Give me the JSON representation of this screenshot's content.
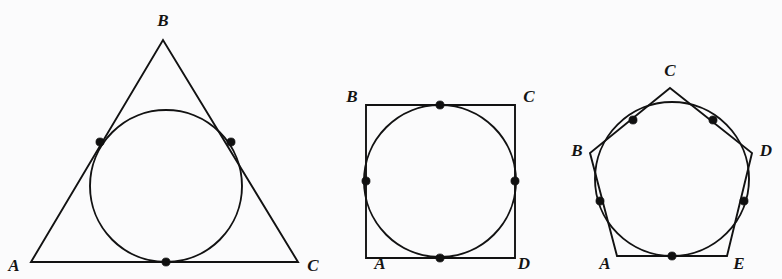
{
  "document": {
    "title": "Circles inscribed in polygons",
    "background_color": "#fbfbfc",
    "ink_color": "#121212",
    "width": 782,
    "height": 279
  },
  "figures": [
    {
      "id": "triangle-figure",
      "name": "triangle-with-inscribed-circle",
      "polygon_type": "triangle",
      "polygon_points": "31,262 163,40 298,262",
      "circle": {
        "cx": 166,
        "cy": 186,
        "r": 76
      },
      "vertices": [
        {
          "label": "A",
          "x": 31,
          "y": 262,
          "label_x": 14,
          "label_y": 267
        },
        {
          "label": "B",
          "x": 163,
          "y": 40,
          "label_x": 163,
          "label_y": 22
        },
        {
          "label": "C",
          "x": 298,
          "y": 262,
          "label_x": 313,
          "label_y": 267
        }
      ],
      "tangent_points": [
        {
          "name": "tangent-left",
          "x": 100,
          "y": 142
        },
        {
          "name": "tangent-right",
          "x": 231,
          "y": 142
        },
        {
          "name": "tangent-bottom",
          "x": 166,
          "y": 262
        }
      ]
    },
    {
      "id": "square-figure",
      "name": "square-with-inscribed-circle",
      "polygon_type": "square",
      "polygon_points": "366,105 515,105 515,258 366,258",
      "circle": {
        "cx": 440,
        "cy": 181,
        "r": 76
      },
      "vertices": [
        {
          "label": "B",
          "x": 366,
          "y": 105,
          "label_x": 352,
          "label_y": 98
        },
        {
          "label": "C",
          "x": 515,
          "y": 105,
          "label_x": 529,
          "label_y": 98
        },
        {
          "label": "A",
          "x": 366,
          "y": 258,
          "label_x": 380,
          "label_y": 265
        },
        {
          "label": "D",
          "x": 515,
          "y": 258,
          "label_x": 524,
          "label_y": 265
        }
      ],
      "tangent_points": [
        {
          "name": "tangent-top",
          "x": 440,
          "y": 105
        },
        {
          "name": "tangent-right",
          "x": 515,
          "y": 181
        },
        {
          "name": "tangent-bottom",
          "x": 440,
          "y": 258
        },
        {
          "name": "tangent-left",
          "x": 366,
          "y": 181
        }
      ]
    },
    {
      "id": "pentagon-figure",
      "name": "pentagon-with-inscribed-circle",
      "polygon_type": "pentagon",
      "polygon_points": "670,88 752,153 727,256 617,256 590,153",
      "circle": {
        "cx": 672,
        "cy": 179,
        "r": 77
      },
      "vertices": [
        {
          "label": "C",
          "x": 670,
          "y": 88,
          "label_x": 670,
          "label_y": 72
        },
        {
          "label": "D",
          "x": 752,
          "y": 153,
          "label_x": 766,
          "label_y": 152
        },
        {
          "label": "E",
          "x": 727,
          "y": 256,
          "label_x": 739,
          "label_y": 265
        },
        {
          "label": "A",
          "x": 617,
          "y": 256,
          "label_x": 605,
          "label_y": 265
        },
        {
          "label": "B",
          "x": 590,
          "y": 153,
          "label_x": 577,
          "label_y": 152
        }
      ],
      "tangent_points": [
        {
          "name": "tangent-upper-left",
          "x": 633,
          "y": 120
        },
        {
          "name": "tangent-upper-right",
          "x": 713,
          "y": 120
        },
        {
          "name": "tangent-right",
          "x": 744,
          "y": 201
        },
        {
          "name": "tangent-bottom",
          "x": 672,
          "y": 256
        },
        {
          "name": "tangent-left",
          "x": 600,
          "y": 201
        }
      ]
    }
  ],
  "style": {
    "dot_radius": 4.1,
    "stroke_width": 1.9,
    "label_font_size": 17
  }
}
